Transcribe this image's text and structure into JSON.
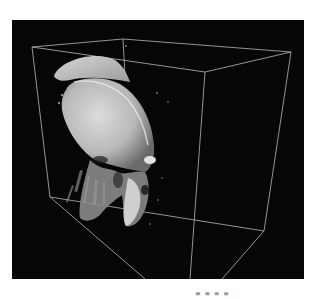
{
  "viewer": {
    "background": "#060606",
    "box_color": "#d8d8d8",
    "render_color": "#c9c9c9",
    "caption": "▄ ▄ ▄ ▄"
  }
}
